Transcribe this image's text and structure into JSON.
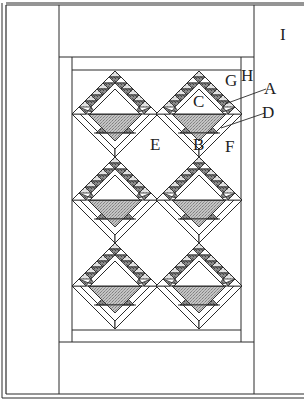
{
  "diagram": {
    "type": "quilt-layout",
    "colors": {
      "line": "#2a2a2a",
      "background": "#ffffff",
      "basket_fill": "#b9b9b9",
      "dark_triangle": "#7a7a7a",
      "light_triangle": "#d4d4d4"
    },
    "blocks": {
      "rows": 3,
      "columns": 2,
      "count": 6
    },
    "labels": {
      "A": "A",
      "B": "B",
      "C": "C",
      "D": "D",
      "E": "E",
      "F": "F",
      "G": "G",
      "H": "H",
      "I": "I"
    }
  }
}
